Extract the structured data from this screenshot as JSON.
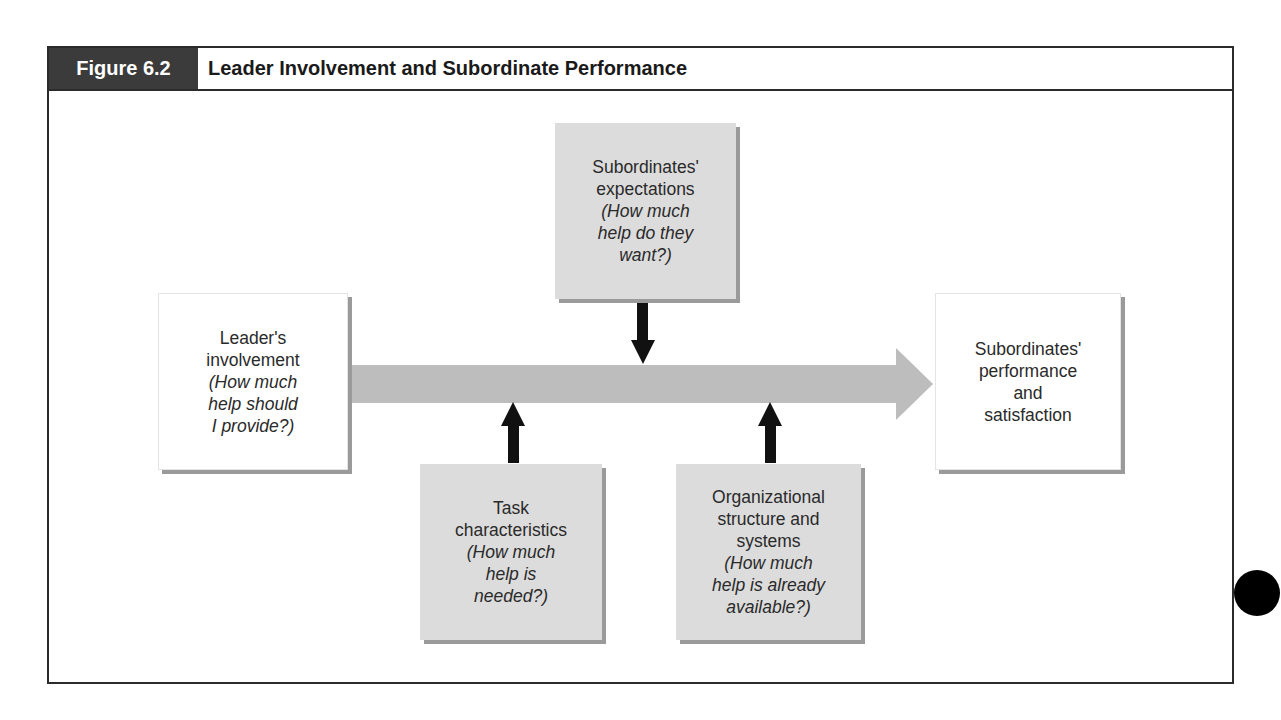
{
  "figure": {
    "label": "Figure 6.2",
    "title": "Leader Involvement and Subordinate Performance"
  },
  "nodes": {
    "leader": {
      "lines": [
        "Leader's",
        "involvement"
      ],
      "question": [
        "(How much",
        "help should",
        "I provide?)"
      ]
    },
    "expectations": {
      "lines": [
        "Subordinates'",
        "expectations"
      ],
      "question": [
        "(How much",
        "help do they",
        "want?)"
      ]
    },
    "task": {
      "lines": [
        "Task",
        "characteristics"
      ],
      "question": [
        "(How much",
        "help is",
        "needed?)"
      ]
    },
    "organization": {
      "lines": [
        "Organizational",
        "structure and",
        "systems"
      ],
      "question": [
        "(How much",
        "help is already",
        "available?)"
      ]
    },
    "outcome": {
      "lines": [
        "Subordinates'",
        "performance",
        "and",
        "satisfaction"
      ],
      "question": []
    }
  },
  "edges": [
    {
      "from": "leader",
      "to": "outcome",
      "style": "wide-grey-arrow"
    },
    {
      "from": "expectations",
      "to": "main-arrow",
      "direction": "down"
    },
    {
      "from": "task",
      "to": "main-arrow",
      "direction": "up"
    },
    {
      "from": "organization",
      "to": "main-arrow",
      "direction": "up"
    }
  ],
  "colors": {
    "label_bg": "#3b3b3b",
    "grey_box": "#dcdcdc",
    "main_arrow": "#bdbdbd",
    "small_arrows": "#111111"
  }
}
